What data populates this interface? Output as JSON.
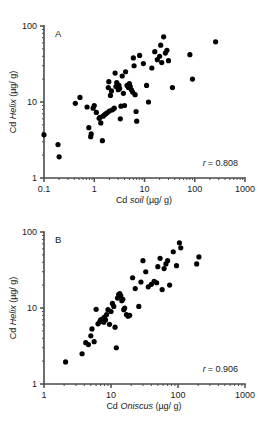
{
  "figure": {
    "panels": [
      {
        "id": "A",
        "letter": "A",
        "xlabel_prefix": "Cd ",
        "xlabel_italic": "soil",
        "xlabel_suffix": " (µg/ g)",
        "ylabel_prefix": "Cd ",
        "ylabel_italic": "Helix",
        "ylabel_suffix": " (µg/ g)",
        "r_symbol": "r",
        "r_value": "= 0.808",
        "xticks": [
          "0.1",
          "1",
          "10",
          "100",
          "1000"
        ],
        "yticks": [
          "1",
          "10",
          "100"
        ]
      },
      {
        "id": "B",
        "letter": "B",
        "xlabel_prefix": "Cd ",
        "xlabel_italic": "Oniscus",
        "xlabel_suffix": " (µg/ g)",
        "ylabel_prefix": "Cd ",
        "ylabel_italic": "Helix",
        "ylabel_suffix": " (µg/ g)",
        "r_symbol": "r",
        "r_value": "= 0.906",
        "xticks": [
          "1",
          "10",
          "100",
          "1000"
        ],
        "yticks": [
          "1",
          "10",
          "100"
        ]
      }
    ]
  },
  "chart_data": [
    {
      "type": "scatter",
      "panel": "A",
      "title": "",
      "xlabel": "Cd soil (µg/ g)",
      "ylabel": "Cd Helix (µg/ g)",
      "xscale": "log",
      "yscale": "log",
      "xlim": [
        0.1,
        1000
      ],
      "ylim": [
        1,
        100
      ],
      "xticks": [
        0.1,
        1,
        10,
        100,
        1000
      ],
      "yticks": [
        1,
        10,
        100
      ],
      "grid": false,
      "legend": null,
      "annotation": "r = 0.808",
      "correlation_r": 0.808,
      "points": [
        [
          0.1,
          3.7
        ],
        [
          0.19,
          2.75
        ],
        [
          0.2,
          1.9
        ],
        [
          0.42,
          9.6
        ],
        [
          0.52,
          11.5
        ],
        [
          0.72,
          8.6
        ],
        [
          0.78,
          4.6
        ],
        [
          0.85,
          3.5
        ],
        [
          0.87,
          3.8
        ],
        [
          0.95,
          8.3
        ],
        [
          1.0,
          9.0
        ],
        [
          1.1,
          7.3
        ],
        [
          1.25,
          6.1
        ],
        [
          1.3,
          6.3
        ],
        [
          1.35,
          5.3
        ],
        [
          1.45,
          3.1
        ],
        [
          1.5,
          6.5
        ],
        [
          1.6,
          6.8
        ],
        [
          1.7,
          7.0
        ],
        [
          1.8,
          7.2
        ],
        [
          1.9,
          15.5
        ],
        [
          1.95,
          18.5
        ],
        [
          2.0,
          7.6
        ],
        [
          2.1,
          12.2
        ],
        [
          2.2,
          14.0
        ],
        [
          2.3,
          7.9
        ],
        [
          2.5,
          8.3
        ],
        [
          2.6,
          24.0
        ],
        [
          2.7,
          16.0
        ],
        [
          2.8,
          18.0
        ],
        [
          2.9,
          17.0
        ],
        [
          3.0,
          14.5
        ],
        [
          3.1,
          16.5
        ],
        [
          3.2,
          15.0
        ],
        [
          3.3,
          6.0
        ],
        [
          3.4,
          8.8
        ],
        [
          3.6,
          22.0
        ],
        [
          3.8,
          13.0
        ],
        [
          4.0,
          9.0
        ],
        [
          4.2,
          25.0
        ],
        [
          4.5,
          16.5
        ],
        [
          4.8,
          15.5
        ],
        [
          5.0,
          17.5
        ],
        [
          5.2,
          16.0
        ],
        [
          5.5,
          14.5
        ],
        [
          5.8,
          13.5
        ],
        [
          6.0,
          38.0
        ],
        [
          6.2,
          30.0
        ],
        [
          6.5,
          12.5
        ],
        [
          6.8,
          7.5
        ],
        [
          7.0,
          5.6
        ],
        [
          8.0,
          41.0
        ],
        [
          9.5,
          32.0
        ],
        [
          11.0,
          16.5
        ],
        [
          12.0,
          10.0
        ],
        [
          14.0,
          28.0
        ],
        [
          16.0,
          46.0
        ],
        [
          18.0,
          36.0
        ],
        [
          20.0,
          40.0
        ],
        [
          21.0,
          56.0
        ],
        [
          22.0,
          33.0
        ],
        [
          24.0,
          72.0
        ],
        [
          26.0,
          44.0
        ],
        [
          28.0,
          48.0
        ],
        [
          30.0,
          35.0
        ],
        [
          36.0,
          15.5
        ],
        [
          80.0,
          42.0
        ],
        [
          90.0,
          20.0
        ],
        [
          260.0,
          62.0
        ]
      ]
    },
    {
      "type": "scatter",
      "panel": "B",
      "title": "",
      "xlabel": "Cd Oniscus (µg/ g)",
      "ylabel": "Cd Helix (µg/ g)",
      "xscale": "log",
      "yscale": "log",
      "xlim": [
        1,
        1000
      ],
      "ylim": [
        1,
        100
      ],
      "xticks": [
        1,
        10,
        100,
        1000
      ],
      "yticks": [
        1,
        10,
        100
      ],
      "grid": false,
      "legend": null,
      "annotation": "r = 0.906",
      "correlation_r": 0.906,
      "points": [
        [
          2.1,
          1.95
        ],
        [
          3.7,
          2.5
        ],
        [
          4.2,
          3.5
        ],
        [
          4.6,
          3.3
        ],
        [
          5.0,
          4.3
        ],
        [
          5.2,
          5.3
        ],
        [
          5.6,
          3.6
        ],
        [
          6.0,
          9.6
        ],
        [
          6.4,
          6.2
        ],
        [
          6.8,
          6.6
        ],
        [
          7.0,
          7.0
        ],
        [
          7.2,
          6.8
        ],
        [
          7.5,
          7.2
        ],
        [
          7.8,
          6.5
        ],
        [
          8.0,
          7.6
        ],
        [
          8.3,
          7.0
        ],
        [
          8.6,
          8.2
        ],
        [
          9.0,
          9.5
        ],
        [
          9.5,
          6.1
        ],
        [
          10.0,
          9.0
        ],
        [
          10.5,
          11.5
        ],
        [
          11.0,
          10.5
        ],
        [
          11.5,
          5.6
        ],
        [
          12.0,
          3.0
        ],
        [
          12.5,
          13.5
        ],
        [
          13.0,
          15.0
        ],
        [
          13.5,
          15.5
        ],
        [
          14.0,
          14.5
        ],
        [
          14.5,
          12.5
        ],
        [
          15.0,
          13.0
        ],
        [
          15.5,
          9.5
        ],
        [
          16.0,
          10.0
        ],
        [
          17.0,
          8.2
        ],
        [
          18.0,
          7.8
        ],
        [
          19.0,
          8.0
        ],
        [
          21.0,
          25.0
        ],
        [
          23.0,
          18.0
        ],
        [
          26.0,
          10.5
        ],
        [
          28.0,
          22.0
        ],
        [
          30.0,
          42.0
        ],
        [
          33.0,
          30.0
        ],
        [
          36.0,
          19.0
        ],
        [
          40.0,
          20.5
        ],
        [
          44.0,
          22.5
        ],
        [
          48.0,
          21.5
        ],
        [
          50.0,
          35.0
        ],
        [
          54.0,
          45.0
        ],
        [
          58.0,
          17.5
        ],
        [
          62.0,
          33.0
        ],
        [
          66.0,
          38.0
        ],
        [
          70.0,
          42.0
        ],
        [
          75.0,
          20.0
        ],
        [
          85.0,
          55.0
        ],
        [
          95.0,
          36.0
        ],
        [
          105.0,
          72.0
        ],
        [
          110.0,
          62.0
        ],
        [
          190.0,
          38.0
        ],
        [
          205.0,
          47.0
        ]
      ]
    }
  ]
}
